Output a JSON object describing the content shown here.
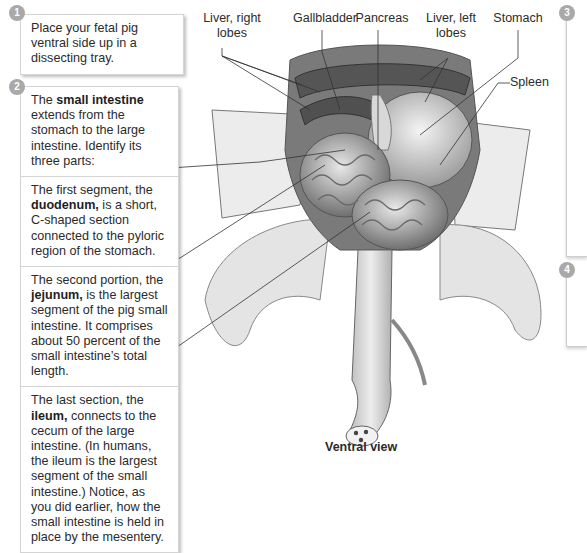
{
  "steps": [
    {
      "number": "1",
      "text": "Place your fetal pig ventral side up in a dissecting tray."
    },
    {
      "number": "2",
      "sections": [
        {
          "pre": "The ",
          "bold": "small intestine",
          "post": " extends from the stomach to the large intestine. Identify its three parts:"
        },
        {
          "pre": "The first segment, the ",
          "bold": "duodenum,",
          "post": " is a short, C-shaped section connected to the pyloric region of the stomach."
        },
        {
          "pre": "The second portion, the ",
          "bold": "jejunum,",
          "post": " is the largest segment of the pig small intestine. It comprises about 50 percent of the small intestine’s total length."
        },
        {
          "pre": "The last section, the ",
          "bold": "ileum,",
          "post": " connects to the cecum of the large intestine. (In humans, the ileum is the largest segment of the small intestine.) Notice, as you did earlier, how the small intestine is held in place by the mesentery."
        }
      ]
    },
    {
      "number": "3"
    },
    {
      "number": "4"
    }
  ],
  "labels": {
    "liver_right": "Liver, right lobes",
    "gallbladder": "Gallbladder",
    "pancreas": "Pancreas",
    "liver_left": "Liver, left lobes",
    "stomach": "Stomach",
    "spleen": "Spleen"
  },
  "caption": "Ventral view",
  "colors": {
    "badge": "#a9a9a9",
    "border": "#d4d4d4",
    "text": "#2b2b2b"
  }
}
